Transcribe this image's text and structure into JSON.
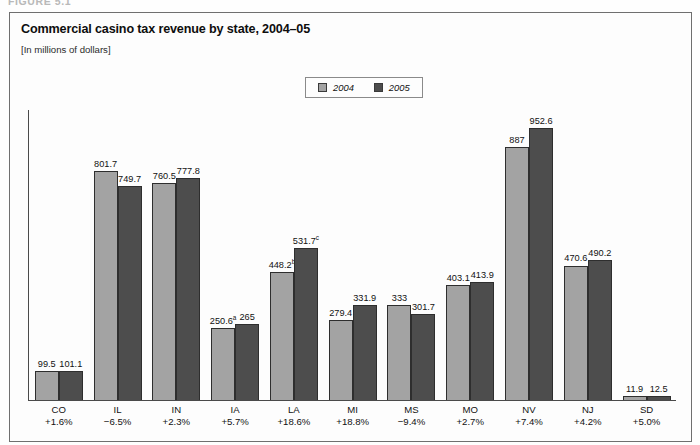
{
  "figure": {
    "number_label": "FIGURE 5.1"
  },
  "title": "Commercial casino tax revenue by state, 2004–05",
  "subtitle": "[In millions of dollars]",
  "legend": {
    "position": "top-center",
    "entries": [
      {
        "label": "2004",
        "color": "#a3a3a3",
        "icon": "square-swatch-icon"
      },
      {
        "label": "2005",
        "color": "#4d4d4d",
        "icon": "square-swatch-icon"
      }
    ]
  },
  "chart_data": {
    "type": "bar",
    "title": "Commercial casino tax revenue by state, 2004–05",
    "subtitle": "[In millions of dollars]",
    "xlabel": "",
    "ylabel": "",
    "ylim": [
      0,
      1000
    ],
    "grid": false,
    "legend_position": "top-center",
    "categories": [
      "CO",
      "IL",
      "IN",
      "IA",
      "LA",
      "MI",
      "MS",
      "MO",
      "NV",
      "NJ",
      "SD"
    ],
    "category_sublabels": [
      "+1.6%",
      "−6.5%",
      "+2.3%",
      "+5.7%",
      "+18.6%",
      "+18.8%",
      "−9.4%",
      "+2.7%",
      "+7.4%",
      "+4.2%",
      "+5.0%"
    ],
    "series": [
      {
        "name": "2004",
        "color": "#a3a3a3",
        "values": [
          99.5,
          801.7,
          760.5,
          250.6,
          448.2,
          279.4,
          333,
          403.1,
          887,
          470.6,
          11.9
        ],
        "labels": [
          "99.5",
          "801.7",
          "760.5",
          "250.6",
          "448.2",
          "279.4",
          "333",
          "403.1",
          "887",
          "470.6",
          "11.9"
        ],
        "label_superscripts": [
          "",
          "",
          "",
          "a",
          "b",
          "",
          "",
          "",
          "",
          "",
          ""
        ]
      },
      {
        "name": "2005",
        "color": "#4d4d4d",
        "values": [
          101.1,
          749.7,
          777.8,
          265,
          531.7,
          331.9,
          301.7,
          413.9,
          952.6,
          490.2,
          12.5
        ],
        "labels": [
          "101.1",
          "749.7",
          "777.8",
          "265",
          "531.7",
          "331.9",
          "301.7",
          "413.9",
          "952.6",
          "490.2",
          "12.5"
        ],
        "label_superscripts": [
          "",
          "",
          "",
          "",
          "c",
          "",
          "",
          "",
          "",
          "",
          ""
        ]
      }
    ]
  }
}
